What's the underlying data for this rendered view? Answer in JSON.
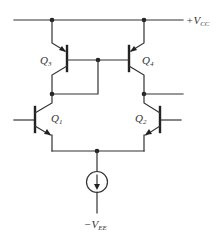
{
  "diagram": {
    "type": "circuit-schematic",
    "supply_positive": {
      "label": "+V",
      "subscript": "CC"
    },
    "supply_negative": {
      "label": "−V",
      "subscript": "EE"
    },
    "transistors": [
      {
        "id": "Q3",
        "label": "Q",
        "subscript": "3",
        "type": "PNP"
      },
      {
        "id": "Q4",
        "label": "Q",
        "subscript": "4",
        "type": "PNP"
      },
      {
        "id": "Q1",
        "label": "Q",
        "subscript": "1",
        "type": "NPN"
      },
      {
        "id": "Q2",
        "label": "Q",
        "subscript": "2",
        "type": "NPN"
      }
    ],
    "current_source": {
      "label": "tail current source"
    },
    "colors": {
      "line": "#333333",
      "background": "#ffffff"
    }
  }
}
